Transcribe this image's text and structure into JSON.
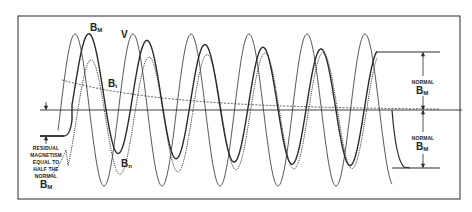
{
  "figure": {
    "frame": {
      "x": 18,
      "y": 16,
      "width": 442,
      "height": 183
    },
    "baseline_y": 110,
    "colors": {
      "ink": "#2a2a2a",
      "background": "#ffffff"
    }
  },
  "labels": {
    "b_m_top": {
      "main": "B",
      "sub": "M"
    },
    "v": "V",
    "b_t": {
      "main": "B",
      "sub": "t"
    },
    "b_n": {
      "main": "B",
      "sub": "n"
    },
    "residual_lines": [
      "RESIDUAL",
      "MAGNETISM",
      "EQUAL TO",
      "HALF THE",
      "NORMAL"
    ],
    "residual_b": {
      "main": "B",
      "sub": "M"
    },
    "normal_upper": {
      "small": "NORMAL",
      "main": "B",
      "sub": "M"
    },
    "normal_lower": {
      "small": "NORMAL",
      "main": "B",
      "sub": "M"
    }
  },
  "curves": {
    "v": {
      "name": "V",
      "style": "thin solid",
      "amplitude": 76,
      "period": 58,
      "first_peak_x": 75,
      "x_start": 58,
      "x_end": 392
    },
    "b_m": {
      "name": "B_M",
      "style": "heavy solid",
      "residual_y": 136,
      "start_x": 40,
      "final_level_y": 52
    },
    "b_n": {
      "name": "B_n",
      "style": "dotted",
      "first_peak_y": 51
    },
    "b_t": {
      "name": "B_t",
      "style": "dashed decay",
      "start": [
        62,
        80
      ],
      "end": [
        440,
        110
      ]
    }
  }
}
